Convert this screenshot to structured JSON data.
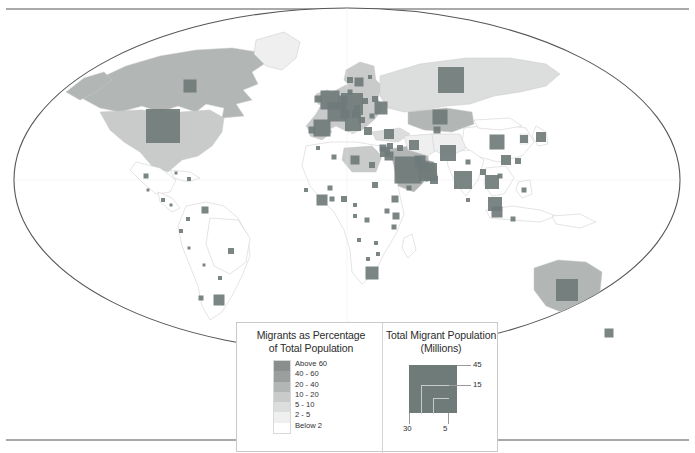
{
  "figure": {
    "type": "choropleth-proportional-symbol-world-map",
    "projection": "elliptical world projection (Winkel/Robinson style)",
    "background": "#ffffff"
  },
  "colors": {
    "symbol": "#6f7b79",
    "frame": "#555555",
    "country_border": "#c9c9c9",
    "legend_border": "#c9c9c9",
    "text": "#2b2b2b",
    "class_above60": "#8a8f8d",
    "class_40_60": "#9a9e9c",
    "class_20_40": "#b2b6b4",
    "class_10_20": "#c8cbca",
    "class_5_10": "#dcdedd",
    "class_2_5": "#eeefee",
    "class_below2": "#ffffff"
  },
  "legend": {
    "choropleth": {
      "title_line1": "Migrants as Percentage",
      "title_line2": "of Total Population",
      "classes": [
        {
          "label": "Above 60",
          "color": "#8a8f8d"
        },
        {
          "label": "40 - 60",
          "color": "#9a9e9c"
        },
        {
          "label": "20 - 40",
          "color": "#b2b6b4"
        },
        {
          "label": "10 - 20",
          "color": "#c8cbca"
        },
        {
          "label": "5 - 10",
          "color": "#dcdedd"
        },
        {
          "label": "2 - 5",
          "color": "#eeefee"
        },
        {
          "label": "Below 2",
          "color": "#ffffff"
        }
      ]
    },
    "symbol_size": {
      "title_line1": "Total Migrant Population",
      "title_line2": "(Millions)",
      "values": [
        {
          "label": "45",
          "position": "right-top"
        },
        {
          "label": "15",
          "position": "right-middle"
        },
        {
          "label": "30",
          "position": "bottom-left"
        },
        {
          "label": "5",
          "position": "bottom-right"
        }
      ]
    }
  },
  "chart_data": {
    "type": "map",
    "encodings": {
      "fill": "Migrants as Percentage of Total Population",
      "size": "Total Migrant Population (Millions)"
    },
    "symbols": [
      {
        "country": "United States",
        "x": 163,
        "y": 126,
        "size": 34,
        "pct_class": "2 - 5"
      },
      {
        "country": "Canada",
        "x": 190,
        "y": 86,
        "size": 13,
        "pct_class": "20 - 40"
      },
      {
        "country": "Mexico",
        "x": 146,
        "y": 176,
        "size": 5,
        "pct_class": "Below 2"
      },
      {
        "country": "Guatemala",
        "x": 148,
        "y": 190,
        "size": 3,
        "pct_class": "Below 2"
      },
      {
        "country": "Cuba",
        "x": 176,
        "y": 173,
        "size": 3,
        "pct_class": "Below 2"
      },
      {
        "country": "Dominican Rep.",
        "x": 189,
        "y": 179,
        "size": 4,
        "pct_class": "2 - 5"
      },
      {
        "country": "Costa Rica",
        "x": 163,
        "y": 200,
        "size": 4,
        "pct_class": "5 - 10"
      },
      {
        "country": "Panama",
        "x": 171,
        "y": 205,
        "size": 3,
        "pct_class": "2 - 5"
      },
      {
        "country": "Venezuela",
        "x": 205,
        "y": 210,
        "size": 7,
        "pct_class": "2 - 5"
      },
      {
        "country": "Colombia",
        "x": 188,
        "y": 219,
        "size": 4,
        "pct_class": "Below 2"
      },
      {
        "country": "Ecuador",
        "x": 181,
        "y": 231,
        "size": 4,
        "pct_class": "2 - 5"
      },
      {
        "country": "Peru",
        "x": 189,
        "y": 248,
        "size": 3,
        "pct_class": "Below 2"
      },
      {
        "country": "Brazil",
        "x": 231,
        "y": 251,
        "size": 6,
        "pct_class": "Below 2"
      },
      {
        "country": "Bolivia",
        "x": 204,
        "y": 265,
        "size": 3,
        "pct_class": "Below 2"
      },
      {
        "country": "Chile",
        "x": 201,
        "y": 298,
        "size": 5,
        "pct_class": "2 - 5"
      },
      {
        "country": "Argentina",
        "x": 219,
        "y": 300,
        "size": 11,
        "pct_class": "2 - 5"
      },
      {
        "country": "Paraguay",
        "x": 220,
        "y": 278,
        "size": 4,
        "pct_class": "2 - 5"
      },
      {
        "country": "United Kingdom",
        "x": 330,
        "y": 100,
        "size": 19,
        "pct_class": "10 - 20"
      },
      {
        "country": "Ireland",
        "x": 318,
        "y": 99,
        "size": 7,
        "pct_class": "10 - 20"
      },
      {
        "country": "France",
        "x": 337,
        "y": 112,
        "size": 19,
        "pct_class": "10 - 20"
      },
      {
        "country": "Spain",
        "x": 322,
        "y": 128,
        "size": 17,
        "pct_class": "10 - 20"
      },
      {
        "country": "Portugal",
        "x": 312,
        "y": 130,
        "size": 7,
        "pct_class": "5 - 10"
      },
      {
        "country": "Germany",
        "x": 352,
        "y": 104,
        "size": 22,
        "pct_class": "10 - 20"
      },
      {
        "country": "Netherlands",
        "x": 343,
        "y": 100,
        "size": 9,
        "pct_class": "10 - 20"
      },
      {
        "country": "Belgium",
        "x": 340,
        "y": 106,
        "size": 7,
        "pct_class": "10 - 20"
      },
      {
        "country": "Switzerland",
        "x": 345,
        "y": 114,
        "size": 9,
        "pct_class": "20 - 40"
      },
      {
        "country": "Italy",
        "x": 353,
        "y": 123,
        "size": 16,
        "pct_class": "5 - 10"
      },
      {
        "country": "Austria",
        "x": 356,
        "y": 114,
        "size": 8,
        "pct_class": "10 - 20"
      },
      {
        "country": "Czechia",
        "x": 357,
        "y": 108,
        "size": 6,
        "pct_class": "2 - 5"
      },
      {
        "country": "Poland",
        "x": 365,
        "y": 101,
        "size": 6,
        "pct_class": "2 - 5"
      },
      {
        "country": "Sweden",
        "x": 359,
        "y": 82,
        "size": 9,
        "pct_class": "10 - 20"
      },
      {
        "country": "Norway",
        "x": 350,
        "y": 80,
        "size": 6,
        "pct_class": "10 - 20"
      },
      {
        "country": "Finland",
        "x": 370,
        "y": 77,
        "size": 4,
        "pct_class": "2 - 5"
      },
      {
        "country": "Denmark",
        "x": 350,
        "y": 92,
        "size": 5,
        "pct_class": "5 - 10"
      },
      {
        "country": "Greece",
        "x": 368,
        "y": 131,
        "size": 8,
        "pct_class": "5 - 10"
      },
      {
        "country": "Serbia / Balkans",
        "x": 362,
        "y": 120,
        "size": 6,
        "pct_class": "5 - 10"
      },
      {
        "country": "Romania",
        "x": 372,
        "y": 116,
        "size": 5,
        "pct_class": "2 - 5"
      },
      {
        "country": "Ukraine",
        "x": 381,
        "y": 108,
        "size": 13,
        "pct_class": "10 - 20"
      },
      {
        "country": "Belarus",
        "x": 375,
        "y": 99,
        "size": 6,
        "pct_class": "10 - 20"
      },
      {
        "country": "Russia",
        "x": 451,
        "y": 80,
        "size": 26,
        "pct_class": "5 - 10"
      },
      {
        "country": "Kazakhstan",
        "x": 440,
        "y": 117,
        "size": 15,
        "pct_class": "20 - 40"
      },
      {
        "country": "Uzbekistan",
        "x": 437,
        "y": 130,
        "size": 7,
        "pct_class": "2 - 5"
      },
      {
        "country": "Turkey",
        "x": 389,
        "y": 134,
        "size": 10,
        "pct_class": "2 - 5"
      },
      {
        "country": "Israel",
        "x": 385,
        "y": 152,
        "size": 10,
        "pct_class": "Above 60"
      },
      {
        "country": "Jordan",
        "x": 389,
        "y": 156,
        "size": 9,
        "pct_class": "40 - 60"
      },
      {
        "country": "Lebanon",
        "x": 383,
        "y": 148,
        "size": 7,
        "pct_class": "Above 60"
      },
      {
        "country": "Syria",
        "x": 390,
        "y": 146,
        "size": 6,
        "pct_class": "5 - 10"
      },
      {
        "country": "Iraq",
        "x": 400,
        "y": 148,
        "size": 6,
        "pct_class": "Below 2"
      },
      {
        "country": "Iran",
        "x": 414,
        "y": 145,
        "size": 10,
        "pct_class": "2 - 5"
      },
      {
        "country": "Saudi Arabia",
        "x": 408,
        "y": 170,
        "size": 27,
        "pct_class": "20 - 40"
      },
      {
        "country": "United Arab Emirates",
        "x": 428,
        "y": 172,
        "size": 18,
        "pct_class": "Above 60"
      },
      {
        "country": "Kuwait",
        "x": 420,
        "y": 161,
        "size": 11,
        "pct_class": "Above 60"
      },
      {
        "country": "Qatar",
        "x": 425,
        "y": 166,
        "size": 8,
        "pct_class": "Above 60"
      },
      {
        "country": "Oman",
        "x": 434,
        "y": 180,
        "size": 8,
        "pct_class": "40 - 60"
      },
      {
        "country": "Yemen",
        "x": 409,
        "y": 188,
        "size": 5,
        "pct_class": "Below 2"
      },
      {
        "country": "Pakistan",
        "x": 448,
        "y": 153,
        "size": 16,
        "pct_class": "2 - 5"
      },
      {
        "country": "India",
        "x": 463,
        "y": 180,
        "size": 18,
        "pct_class": "Below 2"
      },
      {
        "country": "Nepal",
        "x": 468,
        "y": 162,
        "size": 5,
        "pct_class": "2 - 5"
      },
      {
        "country": "Bangladesh",
        "x": 483,
        "y": 172,
        "size": 6,
        "pct_class": "Below 2"
      },
      {
        "country": "Sri Lanka",
        "x": 468,
        "y": 200,
        "size": 4,
        "pct_class": "Below 2"
      },
      {
        "country": "China",
        "x": 497,
        "y": 142,
        "size": 15,
        "pct_class": "Below 2"
      },
      {
        "country": "Hong Kong",
        "x": 506,
        "y": 160,
        "size": 10,
        "pct_class": "20 - 40"
      },
      {
        "country": "Japan",
        "x": 541,
        "y": 137,
        "size": 10,
        "pct_class": "Below 2"
      },
      {
        "country": "South Korea",
        "x": 524,
        "y": 139,
        "size": 8,
        "pct_class": "Below 2"
      },
      {
        "country": "Taiwan",
        "x": 518,
        "y": 161,
        "size": 6,
        "pct_class": "2 - 5"
      },
      {
        "country": "Thailand",
        "x": 492,
        "y": 182,
        "size": 14,
        "pct_class": "5 - 10"
      },
      {
        "country": "Malaysia",
        "x": 495,
        "y": 204,
        "size": 14,
        "pct_class": "5 - 10"
      },
      {
        "country": "Singapore",
        "x": 497,
        "y": 212,
        "size": 11,
        "pct_class": "Above 60"
      },
      {
        "country": "Indonesia",
        "x": 513,
        "y": 219,
        "size": 5,
        "pct_class": "Below 2"
      },
      {
        "country": "Philippines",
        "x": 524,
        "y": 190,
        "size": 5,
        "pct_class": "Below 2"
      },
      {
        "country": "Vietnam",
        "x": 500,
        "y": 176,
        "size": 5,
        "pct_class": "Below 2"
      },
      {
        "country": "Australia",
        "x": 567,
        "y": 290,
        "size": 22,
        "pct_class": "20 - 40"
      },
      {
        "country": "New Zealand",
        "x": 609,
        "y": 333,
        "size": 9,
        "pct_class": "20 - 40"
      },
      {
        "country": "Morocco",
        "x": 318,
        "y": 148,
        "size": 4,
        "pct_class": "Below 2"
      },
      {
        "country": "Algeria",
        "x": 334,
        "y": 157,
        "size": 5,
        "pct_class": "Below 2"
      },
      {
        "country": "Libya",
        "x": 355,
        "y": 160,
        "size": 9,
        "pct_class": "10 - 20"
      },
      {
        "country": "Egypt",
        "x": 372,
        "y": 165,
        "size": 6,
        "pct_class": "Below 2"
      },
      {
        "country": "Sudan",
        "x": 375,
        "y": 185,
        "size": 6,
        "pct_class": "Below 2"
      },
      {
        "country": "Ethiopia",
        "x": 395,
        "y": 199,
        "size": 7,
        "pct_class": "Below 2"
      },
      {
        "country": "Kenya",
        "x": 396,
        "y": 216,
        "size": 7,
        "pct_class": "2 - 5"
      },
      {
        "country": "Uganda",
        "x": 387,
        "y": 211,
        "size": 5,
        "pct_class": "2 - 5"
      },
      {
        "country": "Tanzania",
        "x": 394,
        "y": 227,
        "size": 5,
        "pct_class": "Below 2"
      },
      {
        "country": "Nigeria",
        "x": 344,
        "y": 199,
        "size": 6,
        "pct_class": "Below 2"
      },
      {
        "country": "Ghana",
        "x": 332,
        "y": 199,
        "size": 5,
        "pct_class": "2 - 5"
      },
      {
        "country": "Cote d'Ivoire",
        "x": 322,
        "y": 200,
        "size": 11,
        "pct_class": "10 - 20"
      },
      {
        "country": "Senegal",
        "x": 306,
        "y": 190,
        "size": 4,
        "pct_class": "2 - 5"
      },
      {
        "country": "Burkina Faso",
        "x": 330,
        "y": 188,
        "size": 5,
        "pct_class": "2 - 5"
      },
      {
        "country": "Cameroon",
        "x": 355,
        "y": 205,
        "size": 4,
        "pct_class": "Below 2"
      },
      {
        "country": "DR Congo",
        "x": 367,
        "y": 220,
        "size": 5,
        "pct_class": "Below 2"
      },
      {
        "country": "Gabon",
        "x": 355,
        "y": 216,
        "size": 4,
        "pct_class": "10 - 20"
      },
      {
        "country": "Angola",
        "x": 359,
        "y": 240,
        "size": 4,
        "pct_class": "Below 2"
      },
      {
        "country": "Zambia",
        "x": 376,
        "y": 243,
        "size": 4,
        "pct_class": "Below 2"
      },
      {
        "country": "Zimbabwe",
        "x": 378,
        "y": 254,
        "size": 4,
        "pct_class": "2 - 5"
      },
      {
        "country": "South Africa",
        "x": 372,
        "y": 273,
        "size": 13,
        "pct_class": "5 - 10"
      },
      {
        "country": "Botswana",
        "x": 368,
        "y": 259,
        "size": 4,
        "pct_class": "2 - 5"
      }
    ],
    "choropleth_regions": [
      {
        "region": "Canada",
        "class": "20 - 40"
      },
      {
        "region": "United States",
        "class": "10 - 20"
      },
      {
        "region": "Greenland",
        "class": "2 - 5"
      },
      {
        "region": "Australia",
        "class": "20 - 40"
      },
      {
        "region": "Saudi Arabia",
        "class": "20 - 40"
      },
      {
        "region": "Gulf States",
        "class": "Above 60"
      },
      {
        "region": "Kazakhstan",
        "class": "20 - 40"
      },
      {
        "region": "Russia",
        "class": "5 - 10"
      },
      {
        "region": "Western Europe",
        "class": "10 - 20"
      },
      {
        "region": "Libya",
        "class": "10 - 20"
      },
      {
        "region": "Most of Africa",
        "class": "Below 2"
      },
      {
        "region": "South America",
        "class": "Below 2"
      },
      {
        "region": "South Asia",
        "class": "Below 2"
      }
    ]
  }
}
